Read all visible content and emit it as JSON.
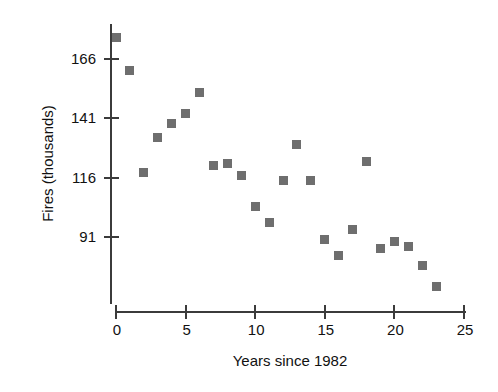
{
  "chart_data": {
    "type": "scatter",
    "title": "",
    "xlabel": "Years since 1982",
    "ylabel": "Fires (thousands)",
    "xlim": [
      0,
      25
    ],
    "ylim": [
      66,
      180
    ],
    "xticks": [
      0,
      5,
      10,
      15,
      20,
      25
    ],
    "yticks": [
      91,
      116,
      141,
      166
    ],
    "xtick_labels": [
      "0",
      "5",
      "10",
      "15",
      "20",
      "25"
    ],
    "ytick_labels": [
      "91",
      "116",
      "141",
      "166"
    ],
    "grid": false,
    "legend": null,
    "marker_color": "#6e6e6e",
    "marker_shape": "square",
    "axis_color": "#3b3b3b",
    "background_color": "#ffffff",
    "x": [
      0,
      1,
      2,
      3,
      4,
      5,
      6,
      7,
      8,
      9,
      10,
      11,
      12,
      13,
      14,
      15,
      16,
      17,
      18,
      19,
      20,
      21,
      22,
      23
    ],
    "y": [
      175,
      161,
      118,
      133,
      139,
      143,
      152,
      121,
      122,
      117,
      104,
      97,
      115,
      130,
      115,
      90,
      83,
      94,
      123,
      86,
      89,
      87,
      79,
      70
    ],
    "points": [
      {
        "x": 0,
        "y": 175
      },
      {
        "x": 1,
        "y": 161
      },
      {
        "x": 2,
        "y": 118
      },
      {
        "x": 3,
        "y": 133
      },
      {
        "x": 4,
        "y": 139
      },
      {
        "x": 5,
        "y": 143
      },
      {
        "x": 6,
        "y": 152
      },
      {
        "x": 7,
        "y": 121
      },
      {
        "x": 8,
        "y": 122
      },
      {
        "x": 9,
        "y": 117
      },
      {
        "x": 10,
        "y": 104
      },
      {
        "x": 11,
        "y": 97
      },
      {
        "x": 12,
        "y": 115
      },
      {
        "x": 13,
        "y": 130
      },
      {
        "x": 14,
        "y": 115
      },
      {
        "x": 15,
        "y": 90
      },
      {
        "x": 16,
        "y": 83
      },
      {
        "x": 17,
        "y": 94
      },
      {
        "x": 18,
        "y": 123
      },
      {
        "x": 19,
        "y": 86
      },
      {
        "x": 20,
        "y": 89
      },
      {
        "x": 21,
        "y": 87
      },
      {
        "x": 22,
        "y": 79
      },
      {
        "x": 23,
        "y": 70
      }
    ]
  }
}
